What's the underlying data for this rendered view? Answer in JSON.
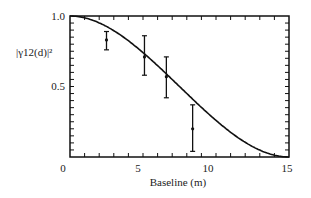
{
  "chart_data": {
    "type": "line",
    "title": "",
    "xlabel": "Baseline (m)",
    "ylabel": "|γ12(d)|²",
    "xlim": [
      0,
      15
    ],
    "ylim": [
      0,
      1.0
    ],
    "x_ticks": [
      "0",
      "5",
      "10",
      "15"
    ],
    "y_ticks": [
      "0.5",
      "1.0"
    ],
    "grid": false,
    "legend": null,
    "series": [
      {
        "name": "model curve",
        "style": "line",
        "x": [
          0,
          1,
          2,
          3,
          4,
          5,
          6,
          7,
          8,
          9,
          10,
          11,
          12,
          13,
          14,
          15
        ],
        "values": [
          1.0,
          0.99,
          0.96,
          0.91,
          0.84,
          0.76,
          0.67,
          0.57,
          0.47,
          0.37,
          0.28,
          0.19,
          0.12,
          0.06,
          0.02,
          0.0
        ]
      },
      {
        "name": "measurements",
        "style": "errorbar",
        "x": [
          2.5,
          5.1,
          6.6,
          8.4
        ],
        "values": [
          0.83,
          0.71,
          0.57,
          0.2
        ],
        "err_low": [
          0.76,
          0.58,
          0.42,
          0.04
        ],
        "err_high": [
          0.89,
          0.86,
          0.71,
          0.37
        ]
      }
    ]
  },
  "labels": {
    "y_axis": "|γ12(d)|²",
    "x_axis": "Baseline (m)",
    "y_tick_top": "1.0",
    "y_tick_mid": "0.5",
    "x_tick_0": "0",
    "x_tick_5": "5",
    "x_tick_10": "10",
    "x_tick_15": "15"
  }
}
